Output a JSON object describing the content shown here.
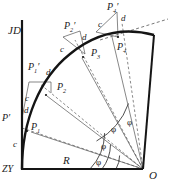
{
  "figure": {
    "type": "geometry-diagram",
    "axis_labels": {
      "vertical_top": "JD",
      "origin_bottom_left": "ZY",
      "center_bottom_right": "O",
      "radius": "R"
    },
    "curve_points": [
      {
        "id": "p1",
        "label": "P",
        "sub": "1"
      },
      {
        "id": "p2",
        "label": "P",
        "sub": "2"
      },
      {
        "id": "p3",
        "label": "P",
        "sub": "3"
      },
      {
        "id": "p4",
        "label": "P",
        "sub": "4"
      }
    ],
    "offset_points": [
      {
        "id": "pp0",
        "label": "P",
        "sub": "",
        "prime": "′"
      },
      {
        "id": "pp1",
        "label": "P",
        "sub": "1",
        "prime": "′"
      },
      {
        "id": "pp2",
        "label": "P",
        "sub": "2",
        "prime": "′"
      },
      {
        "id": "pp4",
        "label": "P",
        "sub": "4",
        "prime": "′"
      }
    ],
    "chord_labels": [
      "c",
      "c",
      "c",
      "c"
    ],
    "offset_labels": [
      "d",
      "d",
      "d"
    ],
    "angle_labels": [
      "φ",
      "φ",
      "φ",
      "φ"
    ],
    "colors": {
      "ink": "#1b1b1b",
      "curve": "#141414",
      "thin": "#4a4a4a",
      "paper": "#ffffff"
    }
  }
}
